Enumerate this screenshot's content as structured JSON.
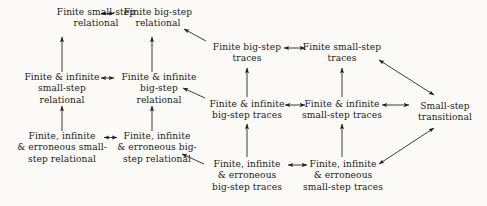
{
  "diagram": {
    "background_color": "#fbfaf7",
    "line_color": "#1b1b1b",
    "nodes": [
      {
        "id": "fin-small-rel",
        "label": "Finite small-step\nrelational",
        "cx": 96,
        "cy": 18
      },
      {
        "id": "fin-big-rel",
        "label": "Finite big-step\nrelational",
        "cx": 158,
        "cy": 18
      },
      {
        "id": "fininf-small-rel",
        "label": "Finite & infinite\nsmall-step\nrelational",
        "cx": 62,
        "cy": 89
      },
      {
        "id": "fininf-big-rel",
        "label": "Finite & infinite\nbig-step\nrelational",
        "cx": 159,
        "cy": 89
      },
      {
        "id": "fininferr-small-rel",
        "label": "Finite, infinite\n& erroneous small-\nstep relational",
        "cx": 62,
        "cy": 148
      },
      {
        "id": "fininferr-big-rel",
        "label": "Finite, infinite\n& erroneous big-\nstep relational",
        "cx": 157,
        "cy": 148
      },
      {
        "id": "fin-big-tr",
        "label": "Finite big-step\ntraces",
        "cx": 247,
        "cy": 53
      },
      {
        "id": "fin-small-tr",
        "label": "Finite small-step\ntraces",
        "cx": 342,
        "cy": 53
      },
      {
        "id": "fininf-big-tr",
        "label": "Finite & infinite\nbig-step traces",
        "cx": 247,
        "cy": 110
      },
      {
        "id": "fininf-small-tr",
        "label": "Finite & infinite\nsmall-step traces",
        "cx": 342,
        "cy": 110
      },
      {
        "id": "fininferr-big-tr",
        "label": "Finite, infinite\n& erroneous\nbig-step traces",
        "cx": 247,
        "cy": 176
      },
      {
        "id": "fininferr-small-tr",
        "label": "Finite, infinite\n& erroneous\nsmall-step traces",
        "cx": 343,
        "cy": 176
      },
      {
        "id": "small-transitional",
        "label": "Small-step\ntransitional",
        "cx": 445,
        "cy": 112
      }
    ],
    "edges": [
      {
        "from": "fin-small-rel",
        "to": "fin-big-rel",
        "kind": "double",
        "orientation": "horizontal"
      },
      {
        "from": "fininf-small-rel",
        "to": "fininf-big-rel",
        "kind": "double",
        "orientation": "horizontal"
      },
      {
        "from": "fininferr-small-rel",
        "to": "fininferr-big-rel",
        "kind": "double",
        "orientation": "horizontal"
      },
      {
        "from": "fin-big-tr",
        "to": "fin-small-tr",
        "kind": "double",
        "orientation": "horizontal"
      },
      {
        "from": "fininf-big-tr",
        "to": "fininf-small-tr",
        "kind": "double",
        "orientation": "horizontal"
      },
      {
        "from": "fininferr-big-tr",
        "to": "fininferr-small-tr",
        "kind": "double",
        "orientation": "horizontal"
      },
      {
        "from": "fininf-small-tr",
        "to": "small-transitional",
        "kind": "double",
        "orientation": "horizontal"
      },
      {
        "from": "fininf-small-rel",
        "to": "fin-small-rel",
        "kind": "single",
        "orientation": "vertical-up"
      },
      {
        "from": "fininf-big-rel",
        "to": "fin-big-rel",
        "kind": "single",
        "orientation": "vertical-up"
      },
      {
        "from": "fininferr-small-rel",
        "to": "fininf-small-rel",
        "kind": "single",
        "orientation": "vertical-up"
      },
      {
        "from": "fininferr-big-rel",
        "to": "fininf-big-rel",
        "kind": "single",
        "orientation": "vertical-up"
      },
      {
        "from": "fininf-big-tr",
        "to": "fin-big-tr",
        "kind": "single",
        "orientation": "vertical-up"
      },
      {
        "from": "fininf-small-tr",
        "to": "fin-small-tr",
        "kind": "single",
        "orientation": "vertical-up"
      },
      {
        "from": "fininferr-big-tr",
        "to": "fininf-big-tr",
        "kind": "single",
        "orientation": "vertical-up"
      },
      {
        "from": "fininferr-small-tr",
        "to": "fininf-small-tr",
        "kind": "single",
        "orientation": "vertical-up"
      },
      {
        "from": "fin-big-tr",
        "to": "fin-big-rel",
        "kind": "single",
        "orientation": "diagonal-up-left"
      },
      {
        "from": "fininf-big-tr",
        "to": "fininf-big-rel",
        "kind": "single",
        "orientation": "diagonal-up-left"
      },
      {
        "from": "fininferr-big-tr",
        "to": "fininferr-big-rel",
        "kind": "single",
        "orientation": "diagonal-up-left"
      },
      {
        "from": "fin-small-tr",
        "to": "small-transitional",
        "kind": "double",
        "orientation": "diagonal-down-right"
      },
      {
        "from": "fininferr-small-tr",
        "to": "small-transitional",
        "kind": "double",
        "orientation": "diagonal-up-right"
      }
    ]
  }
}
